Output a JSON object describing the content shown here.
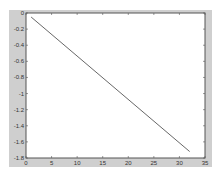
{
  "chart_data": {
    "type": "line",
    "title": "",
    "xlabel": "",
    "ylabel": "",
    "xlim": [
      0,
      35
    ],
    "ylim": [
      -1.8,
      0
    ],
    "grid": false,
    "legend": null,
    "x_ticks": [
      "0",
      "5",
      "10",
      "15",
      "20",
      "25",
      "30",
      "35"
    ],
    "y_ticks": [
      "0",
      "-0.2",
      "-0.4",
      "-0.6",
      "-0.8",
      "-1",
      "-1.2",
      "-1.4",
      "-1.6",
      "-1.8"
    ],
    "series": [
      {
        "name": "line",
        "color": "#404040",
        "x": [
          1,
          32
        ],
        "y": [
          -0.05,
          -1.72
        ]
      }
    ]
  }
}
